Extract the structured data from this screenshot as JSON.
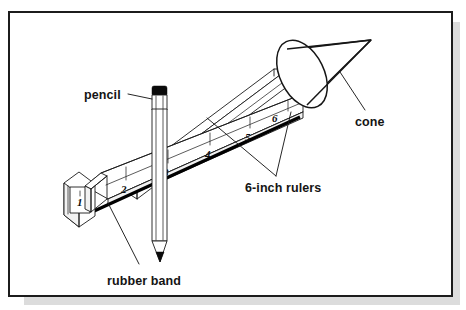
{
  "figure": {
    "frame": {
      "border_color": "#1c1c1c",
      "background": "#ffffff",
      "shadow_color": "#d8d8d8"
    },
    "labels": {
      "pencil": "pencil",
      "rubber_band": "rubber band",
      "rulers": "6-inch rulers",
      "cone": "cone"
    },
    "ruler": {
      "unit_label": "inch",
      "length_inches": 6,
      "tick_numbers": [
        "1",
        "2",
        "3",
        "4",
        "5",
        "6"
      ],
      "count": 2
    },
    "objects": [
      {
        "name": "pencil",
        "label": "pencil"
      },
      {
        "name": "rubber-band",
        "label": "rubber band"
      },
      {
        "name": "6-inch-rulers",
        "label": "6-inch rulers"
      },
      {
        "name": "cone",
        "label": "cone"
      }
    ],
    "colors": {
      "line": "#1a1a1a",
      "fill": "#ffffff",
      "shade": "#f2f2f2",
      "accent_black": "#000000"
    }
  }
}
